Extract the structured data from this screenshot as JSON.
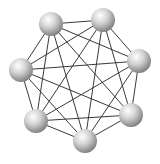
{
  "diagram": {
    "type": "complete-graph",
    "name": "K7",
    "node_count": 7,
    "edge_count": 21,
    "colors": {
      "background": "#ffffff",
      "edge": "#3a3a3a",
      "node_highlight": "#ffffff",
      "node_mid": "#cfcfcf",
      "node_shadow": "#8a8a8a"
    },
    "node_radius": 12,
    "nodes": [
      {
        "id": "n1",
        "x": 51,
        "y": 24
      },
      {
        "id": "n2",
        "x": 103,
        "y": 20
      },
      {
        "id": "n3",
        "x": 139,
        "y": 61
      },
      {
        "id": "n6",
        "x": 131,
        "y": 115
      },
      {
        "id": "n7",
        "x": 85,
        "y": 141
      },
      {
        "id": "n5",
        "x": 36,
        "y": 121
      },
      {
        "id": "n4",
        "x": 21,
        "y": 70
      }
    ]
  }
}
